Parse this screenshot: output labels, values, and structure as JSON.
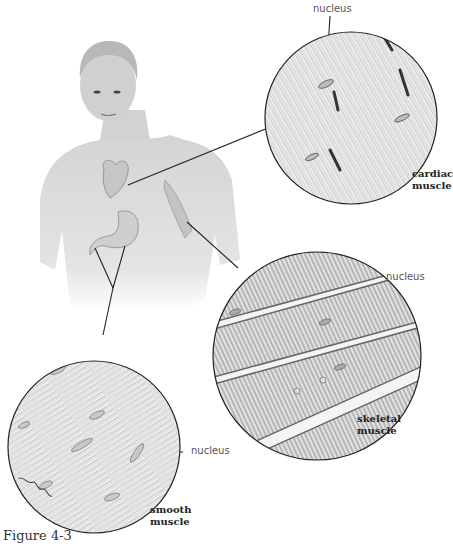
{
  "figure": {
    "caption": "Figure 4-3",
    "signature": "Shoaf"
  },
  "labels": {
    "cardiac_nucleus": "nucleus",
    "cardiac_title_1": "cardiac",
    "cardiac_title_2": "muscle",
    "skeletal_nucleus": "nucleus",
    "skeletal_title_1": "skeletal",
    "skeletal_title_2": "muscle",
    "smooth_nucleus": "nucleus",
    "smooth_title_1": "smooth",
    "smooth_title_2": "muscle"
  },
  "colors": {
    "background": "#ffffff",
    "line": "#222222",
    "skin": "#d9d9d9",
    "tissue": "#e6e6e6",
    "striation": "#9a9a9a"
  }
}
